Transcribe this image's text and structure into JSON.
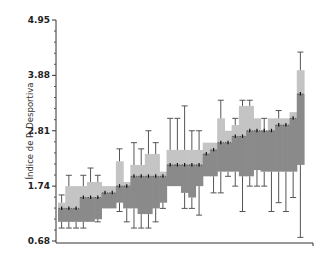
{
  "chart_data": {
    "type": "box",
    "title": "",
    "xlabel": "",
    "ylabel": "Índice de P. Desportiva",
    "ylim": [
      0.68,
      4.95
    ],
    "yticks": [
      0.68,
      1.74,
      2.81,
      3.88,
      4.95
    ],
    "ytick_labels": [
      "0.68",
      "1.74",
      "2.81",
      "3.88",
      "4.95"
    ],
    "grid": false,
    "legend": null,
    "colors": {
      "upper_box": "#c4c4c4",
      "lower_box": "#8a8a8a",
      "whisker": "#555555",
      "median": "#111111",
      "axis": "#333333"
    },
    "series": [
      {
        "median": 1.31,
        "q1": 1.05,
        "q3": 1.42,
        "low": 0.93,
        "high": 1.57
      },
      {
        "median": 1.31,
        "q1": 1.05,
        "q3": 1.74,
        "low": 0.93,
        "high": 1.95
      },
      {
        "median": 1.31,
        "q1": 1.05,
        "q3": 1.74,
        "low": 0.93,
        "high": 1.74
      },
      {
        "median": 1.52,
        "q1": 1.05,
        "q3": 1.74,
        "low": 0.93,
        "high": 1.95
      },
      {
        "median": 1.52,
        "q1": 1.05,
        "q3": 1.82,
        "low": 1.05,
        "high": 2.09
      },
      {
        "median": 1.52,
        "q1": 1.1,
        "q3": 1.82,
        "low": 1.05,
        "high": 1.95
      },
      {
        "median": 1.61,
        "q1": 1.31,
        "q3": 1.74,
        "low": 1.31,
        "high": 1.74
      },
      {
        "median": 1.61,
        "q1": 1.31,
        "q3": 1.74,
        "low": 1.31,
        "high": 1.74
      },
      {
        "median": 1.74,
        "q1": 1.42,
        "q3": 2.22,
        "low": 1.25,
        "high": 2.46
      },
      {
        "median": 1.74,
        "q1": 1.31,
        "q3": 1.82,
        "low": 1.05,
        "high": 1.82
      },
      {
        "median": 1.93,
        "q1": 1.31,
        "q3": 2.15,
        "low": 0.93,
        "high": 2.58
      },
      {
        "median": 1.93,
        "q1": 1.2,
        "q3": 2.15,
        "low": 0.93,
        "high": 2.46
      },
      {
        "median": 1.93,
        "q1": 1.2,
        "q3": 2.36,
        "low": 0.93,
        "high": 2.81
      },
      {
        "median": 1.93,
        "q1": 1.31,
        "q3": 2.36,
        "low": 1.05,
        "high": 2.58
      },
      {
        "median": 1.93,
        "q1": 1.42,
        "q3": 2.02,
        "low": 1.31,
        "high": 2.02
      },
      {
        "median": 2.15,
        "q1": 1.74,
        "q3": 2.44,
        "low": 1.74,
        "high": 3.05
      },
      {
        "median": 2.15,
        "q1": 1.74,
        "q3": 2.44,
        "low": 1.74,
        "high": 3.05
      },
      {
        "median": 2.15,
        "q1": 1.61,
        "q3": 2.44,
        "low": 1.31,
        "high": 3.29
      },
      {
        "median": 2.15,
        "q1": 1.52,
        "q3": 2.44,
        "low": 1.31,
        "high": 2.81
      },
      {
        "median": 2.15,
        "q1": 1.74,
        "q3": 2.44,
        "low": 1.18,
        "high": 2.81
      },
      {
        "median": 2.36,
        "q1": 1.93,
        "q3": 2.58,
        "low": 1.93,
        "high": 2.58
      },
      {
        "median": 2.44,
        "q1": 1.93,
        "q3": 2.58,
        "low": 1.61,
        "high": 2.58
      },
      {
        "median": 2.58,
        "q1": 2.02,
        "q3": 3.05,
        "low": 1.61,
        "high": 3.4
      },
      {
        "median": 2.58,
        "q1": 2.02,
        "q3": 2.81,
        "low": 1.93,
        "high": 2.81
      },
      {
        "median": 2.7,
        "q1": 2.02,
        "q3": 2.92,
        "low": 1.74,
        "high": 3.05
      },
      {
        "median": 2.7,
        "q1": 1.93,
        "q3": 3.29,
        "low": 1.25,
        "high": 3.4
      },
      {
        "median": 2.81,
        "q1": 1.93,
        "q3": 3.29,
        "low": 1.74,
        "high": 3.4
      },
      {
        "median": 2.81,
        "q1": 2.05,
        "q3": 3.05,
        "low": 1.74,
        "high": 3.05
      },
      {
        "median": 2.81,
        "q1": 2.02,
        "q3": 2.81,
        "low": 1.74,
        "high": 3.05
      },
      {
        "median": 2.81,
        "q1": 2.02,
        "q3": 3.05,
        "low": 1.25,
        "high": 3.05
      },
      {
        "median": 2.92,
        "q1": 2.02,
        "q3": 3.05,
        "low": 1.42,
        "high": 3.2
      },
      {
        "median": 2.92,
        "q1": 2.02,
        "q3": 3.05,
        "low": 1.25,
        "high": 3.05
      },
      {
        "median": 3.05,
        "q1": 2.02,
        "q3": 3.17,
        "low": 1.52,
        "high": 3.17
      },
      {
        "median": 3.52,
        "q1": 2.15,
        "q3": 3.98,
        "low": 0.75,
        "high": 4.33
      }
    ]
  }
}
